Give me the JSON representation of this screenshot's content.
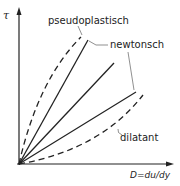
{
  "diagram": {
    "title": "",
    "y_axis_label": "τ",
    "x_axis_label": "D = du/dy",
    "curves": [
      {
        "name": "pseudoplastisch",
        "style": "dashed",
        "shape": "concave"
      },
      {
        "name": "newtonsch",
        "style": "solid",
        "count": 3
      },
      {
        "name": "dilatant",
        "style": "dashed",
        "shape": "convex"
      }
    ],
    "labels": {
      "pseudoplastic": "pseudoplastisch",
      "newtonian": "newtonsch",
      "dilatant": "dilatant",
      "y_axis": "τ",
      "x_axis": "D=du/dy"
    },
    "colors": {
      "ink": "#222222",
      "background": "#ffffff"
    }
  }
}
